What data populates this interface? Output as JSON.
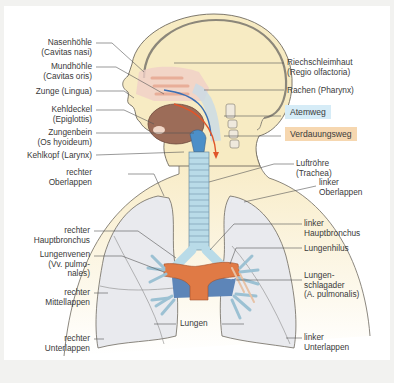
{
  "labels_left": {
    "nasenhoehle": [
      "Nasenhöhle",
      "(Cavitas nasi)"
    ],
    "mundhoehle": [
      "Mundhöhle",
      "(Cavitas oris)"
    ],
    "zunge": [
      "Zunge (Lingua)"
    ],
    "kehldeckel": [
      "Kehldeckel",
      "(Epiglottis)"
    ],
    "zungenbein": [
      "Zungenbein",
      "(Os hyoideum)"
    ],
    "kehlkopf": [
      "Kehlkopf (Larynx)"
    ],
    "rechter_oberlappen": [
      "rechter",
      "Oberlappen"
    ],
    "rechter_hauptbronchus": [
      "rechter",
      "Hauptbronchus"
    ],
    "lungenvenen": [
      "Lungenvenen",
      "(Vv. pulmo-",
      "nales)"
    ],
    "rechter_mittellappen": [
      "rechter",
      "Mittellappen"
    ],
    "rechter_unterlappen": [
      "rechter",
      "Unterlappen"
    ]
  },
  "labels_right": {
    "riechschleimhaut": [
      "Riechschleimhaut",
      "(Regio olfactoria)"
    ],
    "rachen": [
      "Rachen (Pharynx)"
    ],
    "luftroehre": [
      "Luftröhre",
      "(Trachea)"
    ],
    "linker_oberlappen": [
      "linker",
      "Oberlappen"
    ],
    "linker_hauptbronchus": [
      "linker",
      "Hauptbronchus"
    ],
    "lungenhilus": [
      "Lungenhilus"
    ],
    "lungenschlagader": [
      "Lungen-",
      "schlagader",
      "(A. pulmonalis)"
    ],
    "linker_unterlappen": [
      "linker",
      "Unterlappen"
    ]
  },
  "label_center": {
    "lungen": "Lungen"
  },
  "legend": [
    {
      "label": "Atemweg",
      "color": "#d6ecf7"
    },
    {
      "label": "Verdauungsweg",
      "color": "#f6d7b0"
    }
  ],
  "colors": {
    "skin": "#f7ebc3",
    "lung": "#e9eaee",
    "trachea": "#b9dbe8",
    "artery": "#e07a45",
    "vein": "#5d85b8",
    "airway_arrow": "#3b6fb4",
    "food_arrow": "#e0552a"
  }
}
